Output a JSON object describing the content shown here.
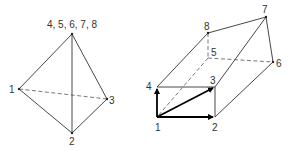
{
  "left_figure": {
    "name": "degenerate-tetrahedron",
    "labels": {
      "top": "4, 5, 6, 7, 8",
      "v1": "1",
      "v2": "2",
      "v3": "3"
    },
    "vertices": {
      "top": [
        72,
        34
      ],
      "v1": [
        19,
        89
      ],
      "v2": [
        72,
        133
      ],
      "v3": [
        107,
        99
      ]
    }
  },
  "right_figure": {
    "name": "hexahedron-prism",
    "labels": {
      "v1": "1",
      "v2": "2",
      "v3": "3",
      "v4": "4",
      "v5": "5",
      "v6": "6",
      "v7": "7",
      "v8": "8"
    },
    "vertices": {
      "v1": [
        157,
        117
      ],
      "v2": [
        215,
        117
      ],
      "v3": [
        215,
        87
      ],
      "v4": [
        157,
        87
      ],
      "v5": [
        208,
        58
      ],
      "v6": [
        273,
        62
      ],
      "v7": [
        266,
        17
      ],
      "v8": [
        208,
        33
      ]
    },
    "vectors": [
      "1->2",
      "1->3",
      "1->4"
    ]
  },
  "colors": {
    "line": "#333333",
    "vector": "#000000",
    "background": "#ffffff"
  }
}
